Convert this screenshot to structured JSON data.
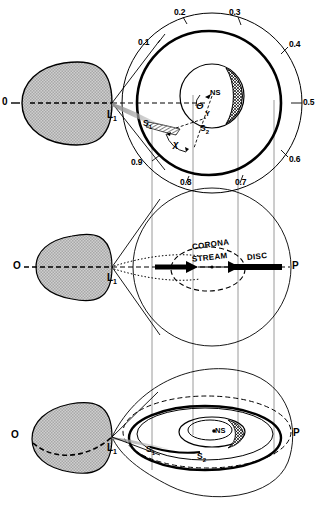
{
  "figure": {
    "type": "astrophysics-binary-star-schematic",
    "panels": [
      {
        "id": "top",
        "view": "face-on / orbital plane view with orbital phase dial",
        "labels": {
          "primary_star": "0",
          "lagrange_point": "L",
          "lagrange_sub": "1",
          "shock_one": "S",
          "shock_one_sub": "1",
          "shock_two": "S",
          "shock_two_sub": "2",
          "compact_object": "NS",
          "angle_theta": "Θ",
          "point_y": "Y",
          "angle_chi": "χ"
        },
        "phase_ticks": [
          "0.1",
          "0.2",
          "0.3",
          "0.4",
          "0.5",
          "0.6",
          "0.7",
          "0.8",
          "0.9"
        ],
        "phase_zero": "0"
      },
      {
        "id": "middle",
        "view": "edge-on view showing vertical structure",
        "labels": {
          "left_marker": "O",
          "right_marker": "P",
          "lagrange_point": "L",
          "lagrange_sub": "1",
          "corona": "CORONA",
          "stream": "STREAM",
          "disc": "DISC"
        }
      },
      {
        "id": "bottom",
        "view": "perspective / inclined three-dimensional view",
        "labels": {
          "left_marker": "O",
          "right_marker": "P",
          "lagrange_point": "L",
          "lagrange_sub": "1",
          "shock_one": "S",
          "shock_one_sub": "1",
          "shock_two": "S",
          "shock_two_sub": "2",
          "compact_object": "NS"
        }
      }
    ],
    "colors": {
      "ink": "#000000",
      "lobe_fill": "#c9c9c9",
      "projection_line": "#9a9a9a",
      "stream_tint": "#b5b5b5"
    }
  }
}
